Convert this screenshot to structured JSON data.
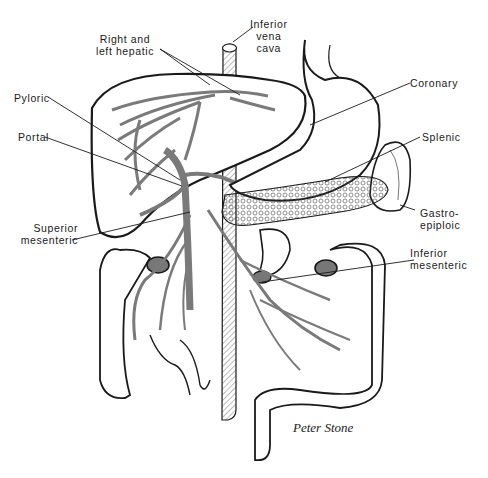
{
  "figure": {
    "signature": "Peter Stone"
  },
  "labels": {
    "right_left_hepatic": "Right and\nleft hepatic",
    "ivc": "Inferior\nvena\ncava",
    "coronary": "Coronary",
    "pyloric": "Pyloric",
    "portal": "Portal",
    "splenic": "Splenic",
    "superior_mesenteric": "Superior\nmesenteric",
    "gastroepiploic": "Gastro-\nepiploic",
    "inferior_mesenteric": "Inferior\nmesenteric"
  },
  "colors": {
    "ink": "#1a1a1a",
    "vessel": "#7a7a7a",
    "background": "#ffffff"
  }
}
